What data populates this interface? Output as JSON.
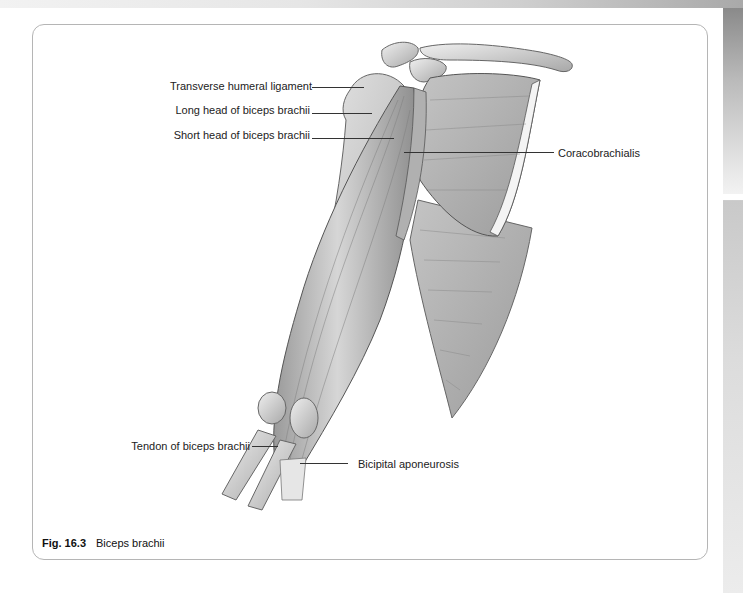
{
  "figure": {
    "number": "Fig. 16.3",
    "title": "Biceps brachii",
    "labels": {
      "transverse_humeral_ligament": "Transverse humeral ligament",
      "long_head": "Long head of biceps brachii",
      "short_head": "Short head of biceps brachii",
      "coracobrachialis": "Coracobrachialis",
      "tendon": "Tendon of biceps brachii",
      "bicipital_aponeurosis": "Bicipital aponeurosis"
    }
  },
  "colors": {
    "illustration_gray": "#c8c8c8",
    "border": "#b5b5b5",
    "text": "#222222"
  }
}
